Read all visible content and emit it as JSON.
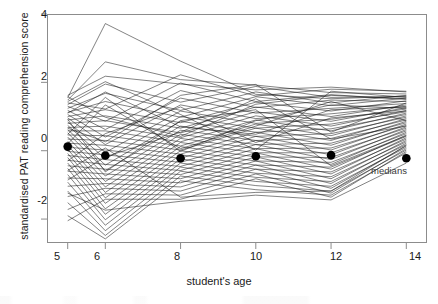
{
  "figure": {
    "background": "#ffffff",
    "frame_color": "#8c8c8c",
    "line_color": "#1a1a1a",
    "median_marker_color": "#000000"
  },
  "labels": {
    "ylabel": "standardised PAT reading comprehension score",
    "xlabel": "student's age",
    "medians_note": "medians"
  },
  "chart_data": {
    "type": "line",
    "title": "",
    "subtitle": "",
    "xlabel": "student's age",
    "ylabel": "standardised PAT reading comprehension score",
    "xlim": [
      4.45,
      14.55
    ],
    "ylim": [
      -2.7,
      4.0
    ],
    "xticks": [
      5,
      6,
      8,
      10,
      12,
      14
    ],
    "xtick_labels": [
      "5",
      "6",
      "8",
      "10",
      "12",
      "14"
    ],
    "yticks": [
      -2,
      0,
      2,
      4
    ],
    "ytick_labels": [
      "-2",
      "0",
      "2",
      "4"
    ],
    "grid": false,
    "legend": null,
    "annotations": [
      {
        "text": "medians",
        "x": 13.5,
        "y": -0.95
      }
    ],
    "x": [
      5,
      6,
      8,
      10,
      12,
      14
    ],
    "medians": {
      "name": "medians",
      "marker": "filled-circle",
      "x": [
        5,
        6,
        8,
        10,
        12,
        14
      ],
      "values": [
        0.12,
        -0.14,
        -0.22,
        -0.16,
        -0.13,
        -0.22
      ]
    },
    "series": [
      {
        "name": "s1",
        "values": [
          1.62,
          2.18,
          1.95,
          1.78,
          1.86,
          1.72
        ]
      },
      {
        "name": "s2",
        "values": [
          1.55,
          3.72,
          2.62,
          1.65,
          1.52,
          1.6
        ]
      },
      {
        "name": "s3",
        "values": [
          1.48,
          2.6,
          2.08,
          1.92,
          1.7,
          1.66
        ]
      },
      {
        "name": "s4",
        "values": [
          1.4,
          1.22,
          2.22,
          1.6,
          1.8,
          1.74
        ]
      },
      {
        "name": "s5",
        "values": [
          1.35,
          1.95,
          1.42,
          1.88,
          1.56,
          1.58
        ]
      },
      {
        "name": "s6",
        "values": [
          1.3,
          0.86,
          1.98,
          1.44,
          1.64,
          1.5
        ]
      },
      {
        "name": "s7",
        "values": [
          1.24,
          1.68,
          1.18,
          1.72,
          1.4,
          1.62
        ]
      },
      {
        "name": "s8",
        "values": [
          1.18,
          0.62,
          1.76,
          1.26,
          1.48,
          1.44
        ]
      },
      {
        "name": "s9",
        "values": [
          1.12,
          1.44,
          0.98,
          1.58,
          1.32,
          1.54
        ]
      },
      {
        "name": "s10",
        "values": [
          1.06,
          0.4,
          1.54,
          1.1,
          1.24,
          1.38
        ]
      },
      {
        "name": "s11",
        "values": [
          1.0,
          1.2,
          0.82,
          1.42,
          1.16,
          1.46
        ]
      },
      {
        "name": "s12",
        "values": [
          0.96,
          0.18,
          1.34,
          0.94,
          1.08,
          1.3
        ]
      },
      {
        "name": "s13",
        "values": [
          0.9,
          1.02,
          0.66,
          1.28,
          1.0,
          1.34
        ]
      },
      {
        "name": "s14",
        "values": [
          0.84,
          -0.05,
          1.16,
          0.8,
          0.92,
          1.22
        ]
      },
      {
        "name": "s15",
        "values": [
          0.8,
          0.88,
          0.52,
          1.14,
          0.86,
          1.26
        ]
      },
      {
        "name": "s16",
        "values": [
          0.74,
          -0.24,
          1.0,
          0.66,
          0.78,
          1.14
        ]
      },
      {
        "name": "s17",
        "values": [
          0.68,
          0.72,
          0.38,
          1.02,
          0.72,
          1.18
        ]
      },
      {
        "name": "s18",
        "values": [
          0.62,
          -0.42,
          0.86,
          0.54,
          0.64,
          1.06
        ]
      },
      {
        "name": "s19",
        "values": [
          0.58,
          0.58,
          0.26,
          0.9,
          0.58,
          1.1
        ]
      },
      {
        "name": "s20",
        "values": [
          0.52,
          -0.58,
          0.72,
          0.42,
          0.5,
          0.98
        ]
      },
      {
        "name": "s21",
        "values": [
          0.46,
          0.44,
          0.14,
          0.78,
          0.44,
          1.02
        ]
      },
      {
        "name": "s22",
        "values": [
          0.4,
          -0.74,
          0.6,
          0.3,
          0.36,
          0.9
        ]
      },
      {
        "name": "s23",
        "values": [
          0.34,
          0.3,
          0.02,
          0.66,
          0.3,
          0.94
        ]
      },
      {
        "name": "s24",
        "values": [
          0.28,
          -0.9,
          0.48,
          0.18,
          0.22,
          0.82
        ]
      },
      {
        "name": "s25",
        "values": [
          0.22,
          0.16,
          -0.1,
          0.54,
          0.16,
          0.86
        ]
      },
      {
        "name": "s26",
        "values": [
          0.16,
          -1.06,
          0.36,
          0.06,
          0.08,
          0.74
        ]
      },
      {
        "name": "s27",
        "values": [
          0.1,
          0.02,
          -0.22,
          0.42,
          0.02,
          0.78
        ]
      },
      {
        "name": "s28",
        "values": [
          0.04,
          -1.22,
          0.24,
          -0.06,
          -0.06,
          0.66
        ]
      },
      {
        "name": "s29",
        "values": [
          -0.02,
          -0.12,
          -0.34,
          0.3,
          -0.12,
          0.7
        ]
      },
      {
        "name": "s30",
        "values": [
          -0.08,
          -1.38,
          0.12,
          -0.18,
          -0.2,
          0.58
        ]
      },
      {
        "name": "s31",
        "values": [
          -0.14,
          -0.26,
          -0.46,
          0.18,
          -0.26,
          0.62
        ]
      },
      {
        "name": "s32",
        "values": [
          -0.2,
          -1.54,
          0.0,
          -0.3,
          -0.34,
          0.5
        ]
      },
      {
        "name": "s33",
        "values": [
          -0.28,
          -0.4,
          -0.58,
          0.06,
          -0.4,
          0.54
        ]
      },
      {
        "name": "s34",
        "values": [
          -0.36,
          -1.7,
          -0.12,
          -0.42,
          -0.48,
          0.42
        ]
      },
      {
        "name": "s35",
        "values": [
          -0.44,
          -0.54,
          -0.7,
          -0.06,
          -0.54,
          0.46
        ]
      },
      {
        "name": "s36",
        "values": [
          -0.52,
          -1.86,
          -0.24,
          -0.54,
          -0.62,
          0.34
        ]
      },
      {
        "name": "s37",
        "values": [
          -0.6,
          -0.68,
          -0.82,
          -0.18,
          -0.68,
          0.38
        ]
      },
      {
        "name": "s38",
        "values": [
          -0.7,
          -2.02,
          -0.36,
          -0.66,
          -0.76,
          0.26
        ]
      },
      {
        "name": "s39",
        "values": [
          -0.8,
          -0.82,
          -0.94,
          -0.3,
          -0.82,
          0.3
        ]
      },
      {
        "name": "s40",
        "values": [
          -0.92,
          -2.18,
          -0.48,
          -0.78,
          -0.9,
          0.18
        ]
      },
      {
        "name": "s41",
        "values": [
          -1.04,
          -0.96,
          -1.06,
          -0.42,
          -0.96,
          0.22
        ]
      },
      {
        "name": "s42",
        "values": [
          -1.18,
          -2.34,
          -0.6,
          -0.9,
          -1.04,
          0.1
        ]
      },
      {
        "name": "s43",
        "values": [
          -1.34,
          -1.1,
          -1.18,
          -0.54,
          -1.1,
          0.14
        ]
      },
      {
        "name": "s44",
        "values": [
          -1.52,
          -2.48,
          -0.74,
          -1.02,
          -1.18,
          0.02
        ]
      },
      {
        "name": "s45",
        "values": [
          -1.72,
          -1.26,
          -1.3,
          -0.68,
          -1.24,
          0.06
        ]
      },
      {
        "name": "s46",
        "values": [
          -1.9,
          -2.58,
          -0.88,
          -1.14,
          -1.3,
          -0.06
        ]
      },
      {
        "name": "s47",
        "values": [
          -2.05,
          -1.42,
          -1.42,
          -0.82,
          -1.36,
          -0.02
        ]
      },
      {
        "name": "s48",
        "values": [
          1.58,
          0.98,
          0.42,
          1.36,
          1.62,
          1.52
        ]
      },
      {
        "name": "s49",
        "values": [
          1.1,
          1.72,
          0.7,
          0.48,
          1.2,
          1.28
        ]
      },
      {
        "name": "s50",
        "values": [
          0.66,
          0.26,
          1.62,
          1.94,
          0.54,
          1.4
        ]
      },
      {
        "name": "s51",
        "values": [
          0.2,
          1.34,
          0.06,
          0.72,
          1.44,
          0.88
        ]
      },
      {
        "name": "s52",
        "values": [
          -0.3,
          0.5,
          1.28,
          0.24,
          0.96,
          1.16
        ]
      },
      {
        "name": "s53",
        "values": [
          -0.86,
          -0.18,
          0.54,
          1.52,
          0.34,
          0.72
        ]
      },
      {
        "name": "s54",
        "values": [
          1.44,
          2.02,
          1.06,
          0.02,
          1.74,
          1.56
        ]
      },
      {
        "name": "s55",
        "values": [
          0.92,
          -0.62,
          0.88,
          1.2,
          -0.44,
          0.44
        ]
      },
      {
        "name": "s56",
        "values": [
          0.48,
          1.56,
          -0.02,
          0.88,
          1.34,
          1.24
        ]
      },
      {
        "name": "s57",
        "values": [
          -0.58,
          0.08,
          -1.36,
          -1.22,
          -1.18,
          0.16
        ]
      },
      {
        "name": "s58",
        "values": [
          -1.24,
          -1.74,
          -1.48,
          -1.3,
          -1.44,
          -0.36
        ]
      }
    ]
  }
}
